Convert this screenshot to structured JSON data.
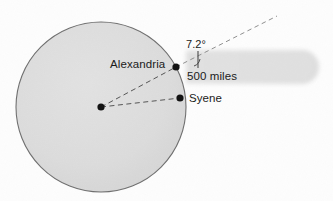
{
  "figure": {
    "background_color": "#fdfdfd"
  },
  "earth": {
    "name": "earth-circle",
    "fill_color": "#dcdcdc",
    "stroke_color": "#6b6b6b",
    "center_x": 101,
    "center_y": 107,
    "radius": 85
  },
  "sunbeam": {
    "name": "sun-ray-beam",
    "color": "#e4e4e4",
    "left_x": 186,
    "right_x": 322,
    "center_y": 67,
    "thickness": 36
  },
  "points": [
    {
      "id": "alexandria",
      "label": "Alexandria",
      "x": 176,
      "y": 67,
      "dot_color": "#111111"
    },
    {
      "id": "syene",
      "label": "Syene",
      "x": 180,
      "y": 98,
      "dot_color": "#111111"
    },
    {
      "id": "center",
      "label": "",
      "x": 101,
      "y": 107,
      "dot_color": "#111111"
    }
  ],
  "labels": {
    "alexandria": "Alexandria",
    "syene": "Syene",
    "distance": "500 miles",
    "angle": "7.2°"
  },
  "lines": {
    "radius_to_alexandria": {
      "name": "dashed-radius-alexandria",
      "style": "dashed",
      "color": "#555555"
    },
    "radius_to_syene": {
      "name": "dashed-radius-syene",
      "style": "dashed",
      "color": "#555555"
    },
    "sun_ray_alexandria": {
      "name": "dashed-sun-ray-alexandria",
      "style": "dashed",
      "color": "#8a8a8a"
    },
    "vertical_reference": {
      "name": "vertical-reference-line",
      "style": "solid",
      "color": "#3a3a3a"
    }
  },
  "angle_marker": {
    "name": "angle-arc-marker",
    "value": "7.2°",
    "color": "#3a3a3a"
  }
}
